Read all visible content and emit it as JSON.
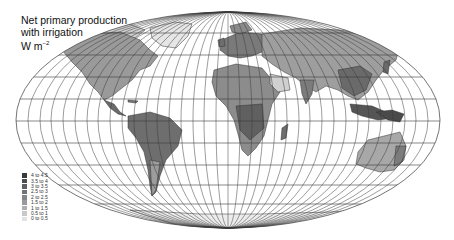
{
  "title": {
    "line1": "Net primary production",
    "line2": "with irrigation",
    "unit_main": "W m",
    "unit_sup": "−2"
  },
  "legend": {
    "items": [
      {
        "label": "4   to 4.5",
        "color": "#3a3a3a"
      },
      {
        "label": "3.5 to 4",
        "color": "#4d4d4d"
      },
      {
        "label": "3   to 3.5",
        "color": "#606060"
      },
      {
        "label": "2.5 to 3",
        "color": "#737373"
      },
      {
        "label": "2   to 2.5",
        "color": "#868686"
      },
      {
        "label": "1.5 to 2",
        "color": "#9a9a9a"
      },
      {
        "label": "1   to 1.5",
        "color": "#afafaf"
      },
      {
        "label": "0.5 to 1",
        "color": "#c8c8c8"
      },
      {
        "label": "0   to 0.5",
        "color": "#e2e2e2"
      }
    ]
  },
  "map": {
    "projection": "Mollweide (equal-area, pseudo-cylindrical)",
    "graticule_color": "#3a3a3a",
    "land_base_color": "#8e8e8e"
  }
}
